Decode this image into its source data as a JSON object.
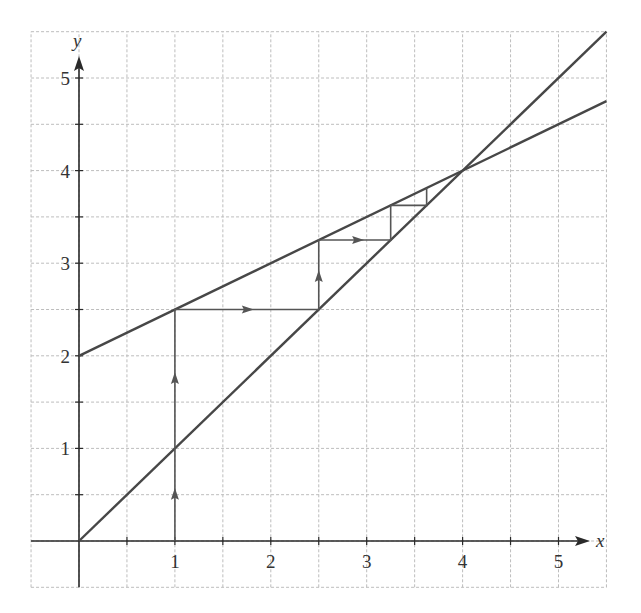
{
  "chart_data": {
    "type": "line",
    "title": "",
    "xlabel": "x",
    "ylabel": "y",
    "xlim": [
      -0.5,
      5.5
    ],
    "ylim": [
      -0.5,
      5.5
    ],
    "grid": true,
    "grid_step": 0.5,
    "x_ticks": [
      1,
      2,
      3,
      4,
      5
    ],
    "y_ticks": [
      1,
      2,
      3,
      4,
      5
    ],
    "series": [
      {
        "name": "y = x",
        "x": [
          0,
          5.5
        ],
        "y": [
          0,
          5.5
        ]
      },
      {
        "name": "y = x/2 + 2",
        "x": [
          0,
          5.5
        ],
        "y": [
          2,
          4.75
        ]
      },
      {
        "name": "cobweb",
        "points": [
          [
            1,
            0
          ],
          [
            1,
            2.5
          ],
          [
            2.5,
            2.5
          ],
          [
            2.5,
            3.25
          ],
          [
            3.25,
            3.25
          ],
          [
            3.25,
            3.625
          ],
          [
            3.625,
            3.625
          ],
          [
            3.625,
            3.8125
          ]
        ]
      }
    ],
    "annotations": [
      {
        "type": "arrow-up",
        "at": [
          1,
          0.5
        ]
      },
      {
        "type": "arrow-up",
        "at": [
          1,
          1.75
        ]
      },
      {
        "type": "arrow-right",
        "at": [
          1.75,
          2.5
        ]
      },
      {
        "type": "arrow-up",
        "at": [
          2.5,
          2.85
        ]
      },
      {
        "type": "arrow-right",
        "at": [
          2.9,
          3.25
        ]
      }
    ],
    "fixed_point": [
      4,
      4
    ]
  },
  "axes": {
    "x_label": "x",
    "y_label": "y",
    "x_tick_labels": [
      "1",
      "2",
      "3",
      "4",
      "5"
    ],
    "y_tick_labels": [
      "1",
      "2",
      "3",
      "4",
      "5"
    ]
  },
  "colors": {
    "grid": "#bdbdbd",
    "axis": "#2a2a2a",
    "curve": "#474747",
    "cobweb": "#555555"
  }
}
